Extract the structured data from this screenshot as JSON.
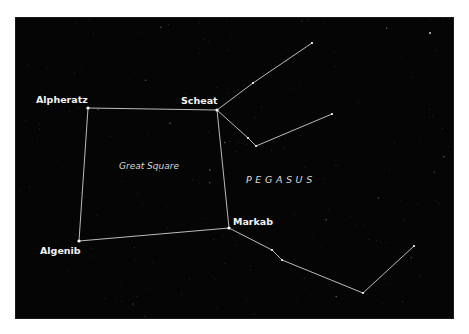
{
  "figure": {
    "background_color": "#050505",
    "line_color": "#cfcfcf",
    "label_color": "#f2f2f2",
    "constellation_name": "PEGASUS",
    "asterism_name": "Great Square",
    "stars": [
      {
        "id": "alpheratz",
        "name": "Alpheratz",
        "x": 88,
        "y": 108,
        "label_x": 36,
        "label_y": 103,
        "labeled": true
      },
      {
        "id": "scheat",
        "name": "Scheat",
        "x": 217,
        "y": 110,
        "label_x": 181,
        "label_y": 104,
        "labeled": true
      },
      {
        "id": "markab",
        "name": "Markab",
        "x": 229,
        "y": 228,
        "label_x": 233,
        "label_y": 225,
        "labeled": true
      },
      {
        "id": "algenib",
        "name": "Algenib",
        "x": 79,
        "y": 241,
        "label_x": 40,
        "label_y": 254,
        "labeled": true
      },
      {
        "id": "s1",
        "name": "",
        "x": 253,
        "y": 83,
        "labeled": false
      },
      {
        "id": "s2",
        "name": "",
        "x": 312,
        "y": 43,
        "labeled": false
      },
      {
        "id": "s3",
        "name": "",
        "x": 248,
        "y": 138,
        "labeled": false
      },
      {
        "id": "s4",
        "name": "",
        "x": 256,
        "y": 146,
        "labeled": false
      },
      {
        "id": "s5",
        "name": "",
        "x": 332,
        "y": 114,
        "labeled": false
      },
      {
        "id": "s6",
        "name": "",
        "x": 272,
        "y": 250,
        "labeled": false
      },
      {
        "id": "s7",
        "name": "",
        "x": 282,
        "y": 260,
        "labeled": false
      },
      {
        "id": "s8",
        "name": "",
        "x": 363,
        "y": 293,
        "labeled": false
      },
      {
        "id": "s9",
        "name": "",
        "x": 414,
        "y": 246,
        "labeled": false
      }
    ],
    "edges": [
      [
        "alpheratz",
        "scheat"
      ],
      [
        "scheat",
        "markab"
      ],
      [
        "markab",
        "algenib"
      ],
      [
        "algenib",
        "alpheratz"
      ],
      [
        "scheat",
        "s1"
      ],
      [
        "s1",
        "s2"
      ],
      [
        "scheat",
        "s3"
      ],
      [
        "s3",
        "s4"
      ],
      [
        "s4",
        "s5"
      ],
      [
        "markab",
        "s6"
      ],
      [
        "s6",
        "s7"
      ],
      [
        "s7",
        "s8"
      ],
      [
        "s8",
        "s9"
      ]
    ],
    "labels": {
      "great_square": {
        "text": "Great Square",
        "x": 119,
        "y": 169
      },
      "pegasus": {
        "text": "PEGASUS",
        "x": 246,
        "y": 183
      }
    }
  }
}
